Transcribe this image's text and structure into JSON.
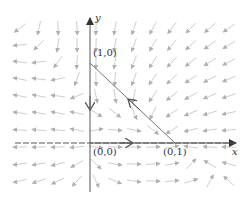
{
  "diagram": {
    "type": "phase-portrait",
    "axes": {
      "x_label": "x",
      "y_label": "y"
    },
    "points": [
      {
        "label": "(1,0)",
        "role": "equilibrium-on-y-axis"
      },
      {
        "label": "(0,0)",
        "role": "origin-equilibrium"
      },
      {
        "label": "(0,1)",
        "role": "equilibrium-on-x-axis"
      }
    ],
    "colors": {
      "axis": "#555555",
      "field": "#b8b8b8",
      "trajectory": "#666666"
    }
  }
}
